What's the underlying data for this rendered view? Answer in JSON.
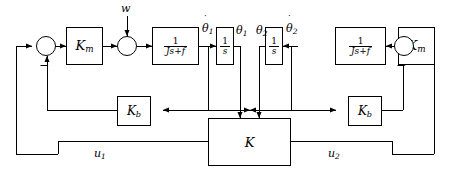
{
  "diagram": {
    "type": "control-block-diagram",
    "background": "#ffffff",
    "line_color": "#000000",
    "width": 450,
    "height": 177
  },
  "blocks": {
    "km_left": {
      "label": "Km",
      "base": "K",
      "sub": "m"
    },
    "km_right": {
      "label": "Km",
      "base": "K",
      "sub": "m"
    },
    "plant_left": {
      "numerator": "1",
      "denominator": "Js+f"
    },
    "plant_right": {
      "numerator": "1",
      "denominator": "Js+f"
    },
    "integrator_left": {
      "numerator": "1",
      "denominator": "s"
    },
    "integrator_right": {
      "numerator": "1",
      "denominator": "s"
    },
    "kb_left": {
      "label": "Kb",
      "base": "K",
      "sub": "b"
    },
    "kb_right": {
      "label": "Kb",
      "base": "K",
      "sub": "b"
    },
    "controller": {
      "label": "K"
    }
  },
  "signals": {
    "disturbance": "w",
    "theta_dot_1": {
      "base": "θ",
      "sub": "1",
      "dotted": true
    },
    "theta_1": {
      "base": "θ",
      "sub": "1",
      "dotted": false
    },
    "theta_2": {
      "base": "θ",
      "sub": "2",
      "dotted": false
    },
    "theta_dot_2": {
      "base": "θ",
      "sub": "2",
      "dotted": true
    },
    "u1": {
      "base": "u",
      "sub": "1"
    },
    "u2": {
      "base": "u",
      "sub": "2"
    }
  },
  "summing_junctions": {
    "left_input": {
      "negative_sign": "−"
    },
    "left_disturbance": {
      "negative_sign": ""
    },
    "right_input": {
      "negative_sign": "−"
    }
  }
}
